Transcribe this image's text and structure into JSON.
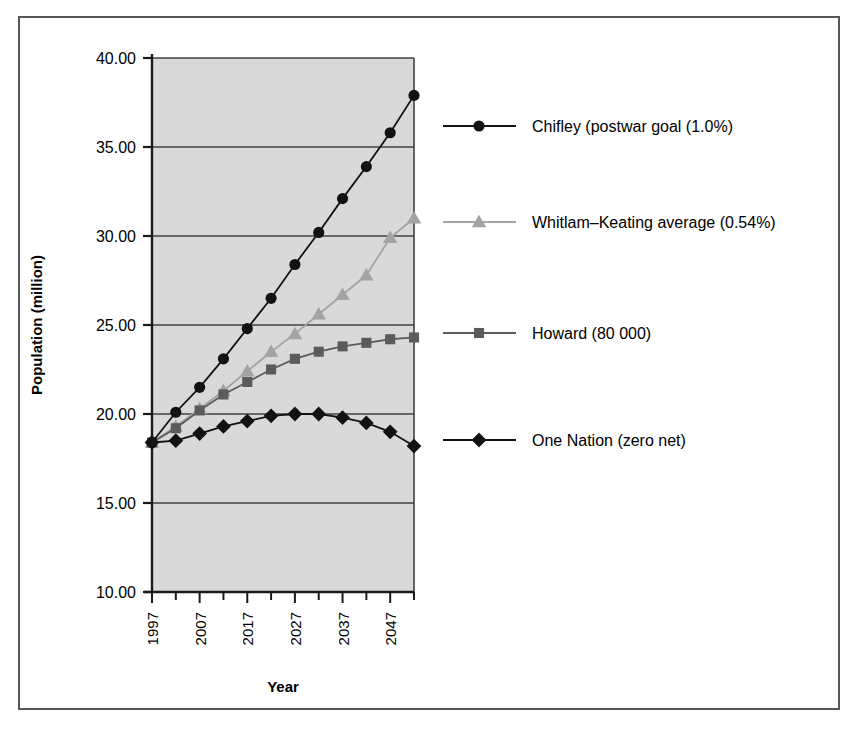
{
  "chart_data": {
    "type": "line",
    "title": "",
    "xlabel": "Year",
    "ylabel": "Population (million)",
    "xlim": [
      1997,
      2052
    ],
    "ylim": [
      10.0,
      40.0
    ],
    "yticks": [
      "10.00",
      "15.00",
      "20.00",
      "25.00",
      "30.00",
      "35.00",
      "40.00"
    ],
    "ytick_values": [
      10,
      15,
      20,
      25,
      30,
      35,
      40
    ],
    "xticks": [
      "1997",
      "2007",
      "2017",
      "2027",
      "2037",
      "2047"
    ],
    "xtick_values": [
      1997,
      2007,
      2017,
      2027,
      2037,
      2047
    ],
    "x_minor_values": [
      2002,
      2012,
      2022,
      2032,
      2042,
      2052
    ],
    "x": [
      1997,
      2002,
      2007,
      2012,
      2017,
      2022,
      2027,
      2032,
      2037,
      2042,
      2047,
      2052
    ],
    "grid": "horizontal",
    "legend_position": "right",
    "plot_background": "#d9d9d9",
    "series": [
      {
        "name": "Chifley (postwar goal (1.0%)",
        "marker": "circle",
        "color": "#121212",
        "values": [
          18.4,
          20.1,
          21.5,
          23.1,
          24.8,
          26.5,
          28.4,
          30.2,
          32.1,
          33.9,
          35.8,
          37.9
        ]
      },
      {
        "name": "Whitlam–Keating average (0.54%)",
        "marker": "triangle",
        "color": "#a3a3a3",
        "values": [
          18.4,
          19.3,
          20.3,
          21.3,
          22.4,
          23.5,
          24.5,
          25.6,
          26.7,
          27.8,
          29.9,
          31.0
        ]
      },
      {
        "name": "Howard (80 000)",
        "marker": "square",
        "color": "#5b5b5b",
        "values": [
          18.4,
          19.2,
          20.2,
          21.1,
          21.8,
          22.5,
          23.1,
          23.5,
          23.8,
          24.0,
          24.2,
          24.3
        ]
      },
      {
        "name": "One Nation (zero net)",
        "marker": "diamond",
        "color": "#121212",
        "values": [
          18.4,
          18.5,
          18.9,
          19.3,
          19.6,
          19.9,
          20.0,
          20.0,
          19.8,
          19.5,
          19.0,
          18.2
        ]
      }
    ]
  },
  "legend": {
    "entries": [
      {
        "label": "Chifley (postwar goal (1.0%)"
      },
      {
        "label": "Whitlam–Keating average (0.54%)"
      },
      {
        "label": "Howard (80 000)"
      },
      {
        "label": "One Nation (zero net)"
      }
    ]
  }
}
